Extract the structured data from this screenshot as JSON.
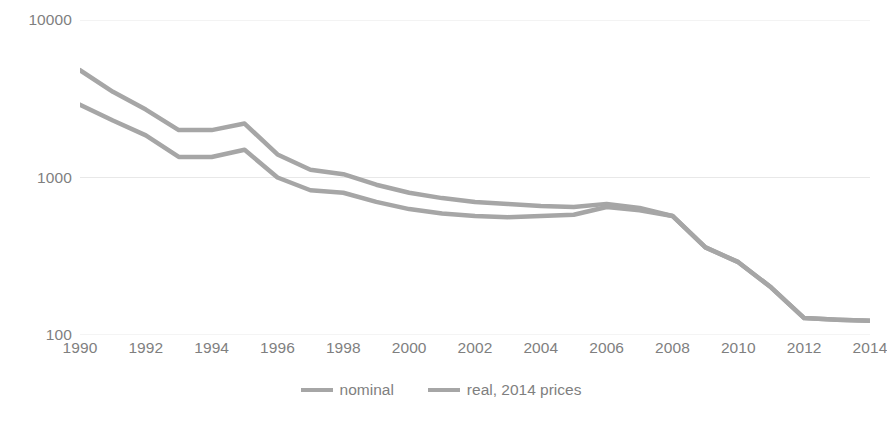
{
  "chart_data": {
    "type": "line",
    "title": "",
    "xlabel": "",
    "ylabel": "",
    "yscale": "log",
    "ylim": [
      100,
      10000
    ],
    "xlim": [
      1990,
      2014
    ],
    "grid": true,
    "legend_position": "bottom",
    "y_ticks": [
      "10000",
      "1000",
      "100"
    ],
    "y_tick_values": [
      10000,
      1000,
      100
    ],
    "x_ticks": [
      "1990",
      "1992",
      "1994",
      "1996",
      "1998",
      "2000",
      "2002",
      "2004",
      "2006",
      "2008",
      "2010",
      "2012",
      "2014"
    ],
    "x_tick_values": [
      1990,
      1992,
      1994,
      1996,
      1998,
      2000,
      2002,
      2004,
      2006,
      2008,
      2010,
      2012,
      2014
    ],
    "x": [
      1990,
      1991,
      1992,
      1993,
      1994,
      1995,
      1996,
      1997,
      1998,
      1999,
      2000,
      2001,
      2002,
      2003,
      2004,
      2005,
      2006,
      2007,
      2008,
      2009,
      2010,
      2011,
      2012,
      2013,
      2014
    ],
    "series": [
      {
        "name": "nominal",
        "color": "#a6a6a6",
        "values": [
          4800,
          3500,
          2700,
          2000,
          2000,
          2200,
          1400,
          1120,
          1050,
          900,
          800,
          740,
          700,
          680,
          660,
          650,
          680,
          640,
          570,
          360,
          290,
          200,
          128,
          125,
          123
        ]
      },
      {
        "name": "real, 2014 prices",
        "color": "#a6a6a6",
        "values": [
          2900,
          2300,
          1850,
          1350,
          1350,
          1500,
          1000,
          830,
          800,
          700,
          630,
          590,
          570,
          560,
          570,
          580,
          650,
          620,
          570,
          360,
          290,
          200,
          128,
          125,
          123
        ]
      }
    ]
  },
  "legend": {
    "entries": [
      {
        "label": "nominal",
        "color": "#a6a6a6"
      },
      {
        "label": "real, 2014 prices",
        "color": "#a6a6a6"
      }
    ]
  },
  "colors": {
    "line": "#a6a6a6",
    "gridline": "#e8e8e8",
    "text": "#7f7f7f",
    "background": "#ffffff"
  }
}
